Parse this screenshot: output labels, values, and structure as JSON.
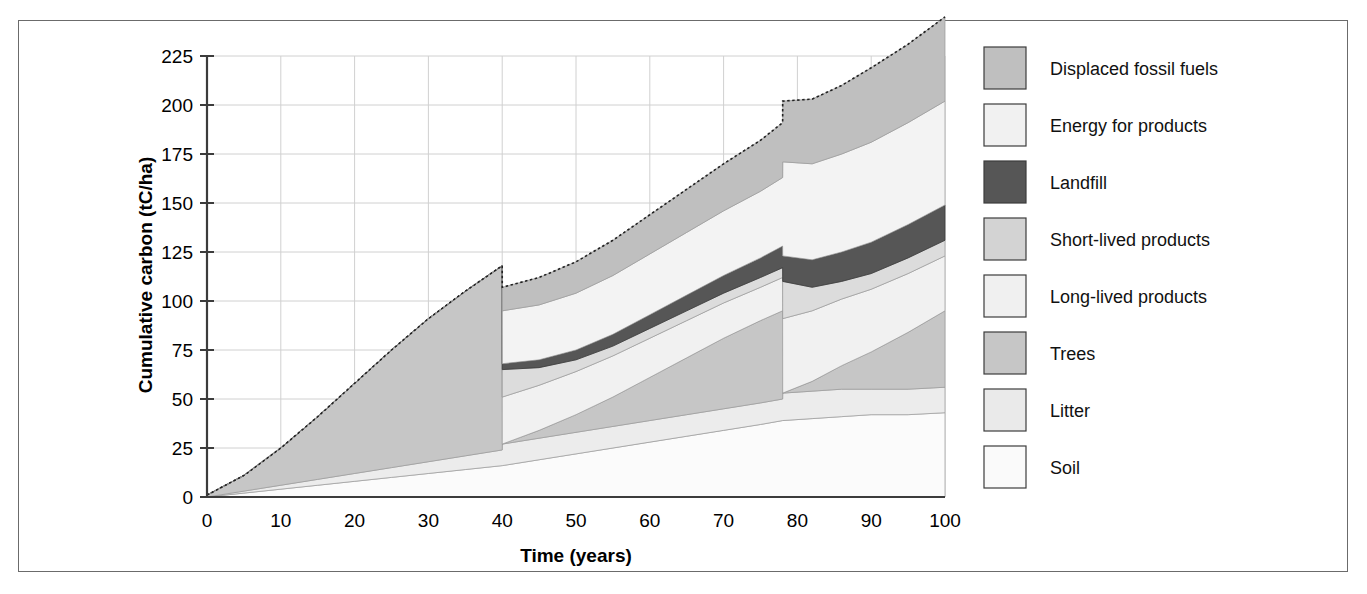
{
  "chart_data": {
    "type": "area",
    "stacked": true,
    "title": "",
    "xlabel": "Time (years)",
    "ylabel": "Cumulative carbon (tC/ha)",
    "xlim": [
      0,
      100
    ],
    "ylim": [
      0,
      225
    ],
    "xticks": [
      0,
      10,
      20,
      30,
      40,
      50,
      60,
      70,
      80,
      90,
      100
    ],
    "yticks": [
      0,
      25,
      50,
      75,
      100,
      125,
      150,
      175,
      200,
      225
    ],
    "grid": true,
    "legend_position": "right",
    "harvest_years": [
      40,
      78
    ],
    "x": [
      0,
      5,
      10,
      15,
      20,
      25,
      30,
      35,
      40,
      40.01,
      45,
      50,
      55,
      60,
      65,
      70,
      75,
      78,
      78.01,
      82,
      86,
      90,
      95,
      100
    ],
    "stack_order_bottom_to_top": [
      "Soil",
      "Litter",
      "Trees",
      "Long-lived products",
      "Short-lived products",
      "Landfill",
      "Energy for products",
      "Displaced fossil fuels"
    ],
    "series": [
      {
        "name": "Soil",
        "color": "#fbfbfb",
        "values": [
          0,
          2,
          4,
          6,
          8,
          10,
          12,
          14,
          16,
          16,
          19,
          22,
          25,
          28,
          31,
          34,
          37,
          39,
          39,
          40,
          41,
          42,
          42,
          43
        ]
      },
      {
        "name": "Litter",
        "color": "#ececec",
        "values": [
          0,
          1,
          2,
          3,
          4,
          5,
          6,
          7,
          8,
          11,
          11,
          11,
          11,
          11,
          11,
          11,
          11,
          11,
          14,
          14,
          14,
          13,
          13,
          13
        ]
      },
      {
        "name": "Trees",
        "color": "#c6c6c6",
        "values": [
          1,
          8,
          19,
          32,
          46,
          60,
          73,
          84,
          94,
          0,
          4,
          9,
          15,
          22,
          29,
          36,
          42,
          45,
          0,
          5,
          12,
          19,
          29,
          39
        ]
      },
      {
        "name": "Long-lived products",
        "color": "#f1f1f1",
        "values": [
          0,
          0,
          0,
          0,
          0,
          0,
          0,
          0,
          0,
          24,
          23,
          22,
          21,
          20,
          19,
          18,
          17,
          17,
          38,
          36,
          34,
          32,
          30,
          28
        ]
      },
      {
        "name": "Short-lived products",
        "color": "#dcdcdc",
        "values": [
          0,
          0,
          0,
          0,
          0,
          0,
          0,
          0,
          0,
          14,
          9,
          6,
          5,
          5,
          5,
          5,
          5,
          5,
          19,
          12,
          9,
          8,
          8,
          8
        ]
      },
      {
        "name": "Landfill",
        "color": "#565656",
        "values": [
          0,
          0,
          0,
          0,
          0,
          0,
          0,
          0,
          0,
          3,
          4,
          5,
          6,
          7,
          8,
          9,
          10,
          11,
          13,
          14,
          15,
          16,
          17,
          18
        ]
      },
      {
        "name": "Energy for products",
        "color": "#f3f3f3",
        "values": [
          0,
          0,
          0,
          0,
          0,
          0,
          0,
          0,
          0,
          27,
          28,
          29,
          30,
          31,
          32,
          33,
          34,
          35,
          48,
          49,
          50,
          51,
          52,
          53
        ]
      },
      {
        "name": "Displaced fossil fuels",
        "color": "#bfbfbf",
        "values": [
          0,
          0,
          0,
          0,
          0,
          0,
          0,
          0,
          0,
          12,
          14,
          16,
          18,
          20,
          22,
          24,
          26,
          28,
          31,
          33,
          35,
          38,
          40,
          43
        ]
      }
    ],
    "legend": [
      {
        "label": "Displaced fossil fuels",
        "color": "#bfbfbf"
      },
      {
        "label": "Energy for products",
        "color": "#f1f1f1"
      },
      {
        "label": "Landfill",
        "color": "#565656"
      },
      {
        "label": "Short-lived products",
        "color": "#d3d3d3"
      },
      {
        "label": "Long-lived products",
        "color": "#f0f0f0"
      },
      {
        "label": "Trees",
        "color": "#c6c6c6"
      },
      {
        "label": "Litter",
        "color": "#eaeaea"
      },
      {
        "label": "Soil",
        "color": "#fafafa"
      }
    ]
  },
  "axis": {
    "x_tick_labels": [
      "0",
      "10",
      "20",
      "30",
      "40",
      "50",
      "60",
      "70",
      "80",
      "90",
      "100"
    ],
    "y_tick_labels": [
      "0",
      "25",
      "50",
      "75",
      "100",
      "125",
      "150",
      "175",
      "200",
      "225"
    ],
    "x_title": "Time (years)",
    "y_title": "Cumulative carbon (tC/ha)"
  },
  "colors": {
    "frame": "#6b6b6b",
    "axis": "#3c3c3c",
    "grid": "#d0d0d0",
    "background": "#ffffff"
  }
}
